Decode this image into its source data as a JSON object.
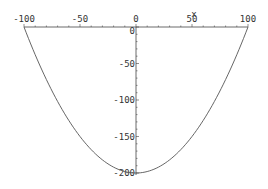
{
  "chart_data": {
    "type": "line",
    "title": "",
    "xlabel": "x",
    "ylabel": "",
    "xlim": [
      -100,
      100
    ],
    "ylim": [
      -200,
      0
    ],
    "x_ticks": [
      -100,
      -50,
      0,
      50,
      100
    ],
    "y_ticks": [
      0,
      -50,
      -100,
      -150,
      -200
    ],
    "x_tick_labels": [
      "-100",
      "-50",
      "0",
      "50",
      "100"
    ],
    "y_tick_labels": [
      "0",
      "-50",
      "-100",
      "-150",
      "-200"
    ],
    "minor_tick_step": 10,
    "grid": false,
    "legend": null,
    "axes_style": "axes through origin (x-axis on top at y=0, y-axis at x=0)",
    "series": [
      {
        "name": "y = x^2/50 - 200",
        "color": "#555555",
        "x": [
          -100,
          -90,
          -80,
          -70,
          -60,
          -50,
          -40,
          -30,
          -20,
          -10,
          0,
          10,
          20,
          30,
          40,
          50,
          60,
          70,
          80,
          90,
          100
        ],
        "y": [
          0,
          -38,
          -72,
          -102,
          -128,
          -150,
          -168,
          -182,
          -192,
          -198,
          -200,
          -198,
          -192,
          -182,
          -168,
          -150,
          -128,
          -102,
          -72,
          -38,
          0
        ]
      }
    ]
  },
  "layout": {
    "origin_px": [
      136,
      27
    ],
    "x_scale_px_per_unit": 1.12,
    "y_scale_px_per_unit": 0.73
  }
}
